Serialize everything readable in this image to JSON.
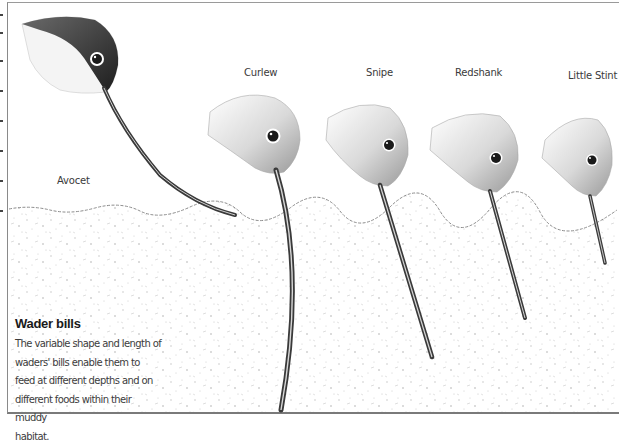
{
  "figure": {
    "title": "Wader bills",
    "caption": "The variable shape and length of waders' bills enable them to feed at different depths and on different foods within their muddy habitat.",
    "caption_lines": [
      "The variable shape and length of",
      "waders' bills enable them to",
      "feed at different depths and on",
      "different foods within their muddy",
      "habitat."
    ]
  },
  "birds": [
    {
      "name": "Avocet",
      "bill": "long, upturned, resting on surface"
    },
    {
      "name": "Curlew",
      "bill": "longest, down-curved, deepest probe"
    },
    {
      "name": "Snipe",
      "bill": "long, straight"
    },
    {
      "name": "Redshank",
      "bill": "medium, straight"
    },
    {
      "name": "Little Stint",
      "bill": "short, straight, shallow probe"
    }
  ],
  "colors": {
    "ink": "#2a2a2a",
    "mud_speckle": "#b5b5b5",
    "frame": "#8a8a8a",
    "paper": "#ffffff"
  }
}
